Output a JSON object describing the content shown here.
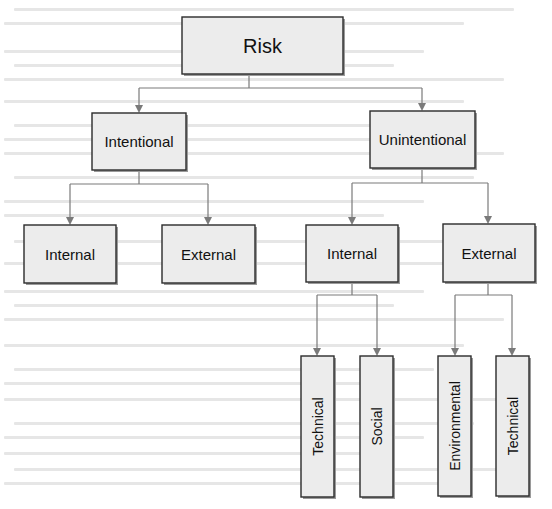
{
  "diagram": {
    "colors": {
      "node_fill": "#ececec",
      "node_border": "#2b2b2b",
      "edge": "#7a7a7a",
      "text": "#111111",
      "background_bleed": "#e6e6e6"
    },
    "nodes": [
      {
        "id": "risk",
        "label": "Risk",
        "x": 182,
        "y": 17,
        "w": 161,
        "h": 57,
        "font": 20,
        "vertical": false
      },
      {
        "id": "intentional",
        "label": "Intentional",
        "x": 92,
        "y": 113,
        "w": 94,
        "h": 57,
        "font": 15,
        "vertical": false
      },
      {
        "id": "unintentional",
        "label": "Unintentional",
        "x": 370,
        "y": 111,
        "w": 105,
        "h": 57,
        "font": 15,
        "vertical": false
      },
      {
        "id": "int-internal",
        "label": "Internal",
        "x": 24,
        "y": 225,
        "w": 92,
        "h": 58,
        "font": 15,
        "vertical": false
      },
      {
        "id": "int-external",
        "label": "External",
        "x": 162,
        "y": 225,
        "w": 93,
        "h": 58,
        "font": 15,
        "vertical": false
      },
      {
        "id": "unint-internal",
        "label": "Internal",
        "x": 306,
        "y": 225,
        "w": 92,
        "h": 57,
        "font": 15,
        "vertical": false
      },
      {
        "id": "unint-external",
        "label": "External",
        "x": 443,
        "y": 224,
        "w": 92,
        "h": 58,
        "font": 15,
        "vertical": false
      },
      {
        "id": "technical-internal",
        "label": "Technical",
        "x": 301,
        "y": 356,
        "w": 33,
        "h": 141,
        "font": 14,
        "vertical": true
      },
      {
        "id": "social",
        "label": "Social",
        "x": 360,
        "y": 356,
        "w": 33,
        "h": 141,
        "font": 14,
        "vertical": true
      },
      {
        "id": "environmental",
        "label": "Environmental",
        "x": 438,
        "y": 356,
        "w": 33,
        "h": 140,
        "font": 14,
        "vertical": true
      },
      {
        "id": "technical-external",
        "label": "Technical",
        "x": 496,
        "y": 356,
        "w": 33,
        "h": 140,
        "font": 14,
        "vertical": true
      }
    ],
    "edges": [
      {
        "from": "risk",
        "stem_x": 249,
        "bar_y": 88,
        "children_x": [
          139,
          422
        ],
        "child_tops": [
          113,
          111
        ]
      },
      {
        "from": "intentional",
        "stem_x": 139,
        "bar_y": 184,
        "children_x": [
          70,
          208
        ],
        "child_tops": [
          225,
          225
        ]
      },
      {
        "from": "unintentional",
        "stem_x": 422,
        "bar_y": 183,
        "children_x": [
          352,
          488
        ],
        "child_tops": [
          225,
          224
        ]
      },
      {
        "from": "unint-internal",
        "stem_x": 352,
        "bar_y": 295,
        "children_x": [
          317,
          377
        ],
        "child_tops": [
          356,
          356
        ]
      },
      {
        "from": "unint-external",
        "stem_x": 488,
        "bar_y": 295,
        "children_x": [
          455,
          512
        ],
        "child_tops": [
          356,
          356
        ]
      }
    ],
    "parent_bottoms": {
      "risk": 74,
      "intentional": 170,
      "unintentional": 168,
      "unint-internal": 282,
      "unint-external": 282
    }
  }
}
